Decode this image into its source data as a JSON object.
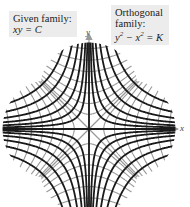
{
  "figure": {
    "type": "orthogonal-trajectories",
    "given_family": {
      "title": "Given family:",
      "equation": "xy = C",
      "color": "#1a1a1a"
    },
    "orthogonal_family": {
      "title_line1": "Orthogonal",
      "title_line2": "family:",
      "equation_lhs": "y",
      "equation_mid": " − x",
      "equation_rhs": " = K",
      "exp": "2",
      "color": "#9a9a9a"
    },
    "axes": {
      "x_label": "x",
      "y_label": "y",
      "color": "#999999"
    },
    "origin_px": [
      89,
      129
    ],
    "scale_px_per_unit": 12,
    "black_C_values": [
      1,
      2.2,
      4,
      6.5,
      10,
      14.5,
      20,
      27
    ],
    "gray_K_values": [
      1.5,
      4.5,
      9,
      15,
      23,
      33,
      45,
      60
    ],
    "region_radius_units": 7.2
  }
}
